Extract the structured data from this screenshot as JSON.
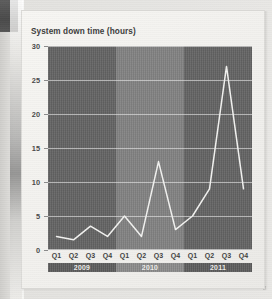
{
  "chart_data": {
    "type": "line",
    "title": "System down time (hours)",
    "xlabel": "",
    "ylabel": "",
    "ylim": [
      0,
      30
    ],
    "yticks": [
      0,
      5,
      10,
      15,
      20,
      25,
      30
    ],
    "grid": true,
    "legend": "none",
    "categories": [
      "Q1",
      "Q2",
      "Q3",
      "Q4",
      "Q1",
      "Q2",
      "Q3",
      "Q4",
      "Q1",
      "Q2",
      "Q3",
      "Q4"
    ],
    "values": [
      2,
      1.5,
      3.5,
      2,
      5,
      2,
      13,
      3,
      5,
      9,
      27,
      9
    ],
    "series": [
      {
        "name": "System down time",
        "color": "#f2f2f0",
        "values": [
          2,
          1.5,
          3.5,
          2,
          5,
          2,
          13,
          3,
          5,
          9,
          27,
          9
        ]
      }
    ],
    "groups": [
      {
        "label": "2009",
        "quarters": [
          "Q1",
          "Q2",
          "Q3",
          "Q4"
        ],
        "values": [
          2,
          1.5,
          3.5,
          2
        ],
        "band": "dark"
      },
      {
        "label": "2010",
        "quarters": [
          "Q1",
          "Q2",
          "Q3",
          "Q4"
        ],
        "values": [
          5,
          2,
          13,
          3
        ],
        "band": "light"
      },
      {
        "label": "2011",
        "quarters": [
          "Q1",
          "Q2",
          "Q3",
          "Q4"
        ],
        "values": [
          5,
          9,
          27,
          9
        ],
        "band": "dark"
      }
    ]
  },
  "colors": {
    "band_dark": "#636363",
    "band_light": "#828282",
    "line": "#f2f2f0",
    "gridline": "#ebebeb",
    "card": "#f4f3f0",
    "page": "#e9e8e5",
    "year_strip_dark": "#5c5c5c",
    "year_strip_light": "#8b8b8b"
  }
}
